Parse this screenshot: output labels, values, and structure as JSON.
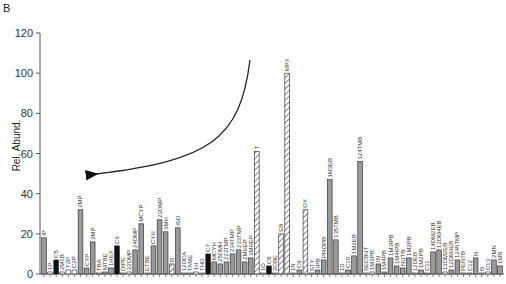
{
  "panel_label": "B",
  "chart_data": {
    "type": "bar",
    "title": "",
    "xlabel": "",
    "ylabel": "Rel. Abund.",
    "ylim": [
      0,
      120
    ],
    "yticks": [
      0,
      20,
      40,
      60,
      80,
      100,
      120
    ],
    "grid": false,
    "legend": null,
    "fill_key": {
      "gray": "#9a9a9a",
      "black": "#111111",
      "hatched": "hatched",
      "white": "#ffffff"
    },
    "annotations": [
      {
        "type": "curved-arrow",
        "from": [
          250,
          60
        ],
        "to": [
          88,
          175
        ],
        "description": "arrow pointing left toward lower-volatility compounds"
      }
    ],
    "bars": [
      {
        "label": "IP",
        "value": 18,
        "fill": "gray"
      },
      {
        "label": "1P",
        "value": 1,
        "fill": "white"
      },
      {
        "label": "C5",
        "value": 7,
        "fill": "black"
      },
      {
        "label": "2M1B",
        "value": 1,
        "fill": "white"
      },
      {
        "label": "T2P",
        "value": 2,
        "fill": "white"
      },
      {
        "label": "C2P",
        "value": 2,
        "fill": "white"
      },
      {
        "label": "2MP",
        "value": 32,
        "fill": "gray"
      },
      {
        "label": "CYP",
        "value": 3,
        "fill": "gray"
      },
      {
        "label": "3MP",
        "value": 16,
        "fill": "gray"
      },
      {
        "label": "TBA",
        "value": 0.5,
        "fill": "white"
      },
      {
        "label": "MTBE",
        "value": 1,
        "fill": "gray"
      },
      {
        "label": "1HEX",
        "value": 3,
        "fill": "gray"
      },
      {
        "label": "C6",
        "value": 14,
        "fill": "black"
      },
      {
        "label": "DIPE",
        "value": 0.5,
        "fill": "white"
      },
      {
        "label": "22DMP",
        "value": 1,
        "fill": "white"
      },
      {
        "label": "24DMP",
        "value": 12,
        "fill": "gray"
      },
      {
        "label": "MCYP",
        "value": 25,
        "fill": "gray"
      },
      {
        "label": "ETBE",
        "value": 0.5,
        "fill": "white"
      },
      {
        "label": "CYH",
        "value": 14,
        "fill": "gray"
      },
      {
        "label": "23DMP",
        "value": 27,
        "fill": "gray"
      },
      {
        "label": "3MH",
        "value": 21,
        "fill": "gray"
      },
      {
        "label": "B",
        "value": 5,
        "fill": "hatched"
      },
      {
        "label": "ISO",
        "value": 23,
        "fill": "gray"
      },
      {
        "label": "12DCA",
        "value": 0.5,
        "fill": "white"
      },
      {
        "label": "TAME",
        "value": 0.5,
        "fill": "white"
      },
      {
        "label": "1H",
        "value": 1,
        "fill": "white"
      },
      {
        "label": "THO",
        "value": 0.5,
        "fill": "white"
      },
      {
        "label": "C7",
        "value": 10,
        "fill": "black"
      },
      {
        "label": "MCYH",
        "value": 6,
        "fill": "gray"
      },
      {
        "label": "25DMH",
        "value": 5,
        "fill": "gray"
      },
      {
        "label": "223TMP",
        "value": 6,
        "fill": "gray"
      },
      {
        "label": "234TMP",
        "value": 10,
        "fill": "gray"
      },
      {
        "label": "233TMP",
        "value": 12,
        "fill": "gray"
      },
      {
        "label": "2MHEP",
        "value": 6,
        "fill": "gray"
      },
      {
        "label": "3MHEP",
        "value": 8,
        "fill": "gray"
      },
      {
        "label": "T",
        "value": 61,
        "fill": "hatched"
      },
      {
        "label": "1O",
        "value": 0.5,
        "fill": "white"
      },
      {
        "label": "C8",
        "value": 4,
        "fill": "black"
      },
      {
        "label": "2OBE",
        "value": 0.5,
        "fill": "white"
      },
      {
        "label": "EB",
        "value": 20,
        "fill": "hatched"
      },
      {
        "label": "MPX",
        "value": 100,
        "fill": "hatched"
      },
      {
        "label": "1N",
        "value": 0.5,
        "fill": "white"
      },
      {
        "label": "C9",
        "value": 2,
        "fill": "gray"
      },
      {
        "label": "OX",
        "value": 32,
        "fill": "hatched"
      },
      {
        "label": "STY",
        "value": 0.5,
        "fill": "white"
      },
      {
        "label": "IPB",
        "value": 2,
        "fill": "gray"
      },
      {
        "label": "PROPB",
        "value": 7,
        "fill": "gray"
      },
      {
        "label": "1M3EB",
        "value": 47,
        "fill": "gray"
      },
      {
        "label": "135TMB",
        "value": 17,
        "fill": "gray"
      },
      {
        "label": "1D",
        "value": 0.5,
        "fill": "white"
      },
      {
        "label": "C10",
        "value": 2,
        "fill": "gray"
      },
      {
        "label": "1M2EB",
        "value": 9,
        "fill": "gray"
      },
      {
        "label": "124TMB",
        "value": 56,
        "fill": "gray"
      },
      {
        "label": "SECBUT",
        "value": 0.5,
        "fill": "white"
      },
      {
        "label": "1M3PB",
        "value": 1,
        "fill": "white"
      },
      {
        "label": "IN",
        "value": 5,
        "fill": "gray"
      },
      {
        "label": "1M4PB",
        "value": 1,
        "fill": "gray"
      },
      {
        "label": "1M3IPB",
        "value": 8,
        "fill": "gray"
      },
      {
        "label": "1M4IPB",
        "value": 4,
        "fill": "gray"
      },
      {
        "label": "NUTB",
        "value": 3,
        "fill": "gray"
      },
      {
        "label": "1M2PB",
        "value": 8,
        "fill": "gray"
      },
      {
        "label": "12DEB",
        "value": 0.5,
        "fill": "white"
      },
      {
        "label": "1M2PB",
        "value": 2,
        "fill": "gray"
      },
      {
        "label": "C11",
        "value": 0.5,
        "fill": "white"
      },
      {
        "label": "14DM2EB",
        "value": 11,
        "fill": "gray"
      },
      {
        "label": "12DM4EB",
        "value": 12,
        "fill": "gray"
      },
      {
        "label": "13DM2EB",
        "value": 1,
        "fill": "white"
      },
      {
        "label": "12DM3EB",
        "value": 2,
        "fill": "gray"
      },
      {
        "label": "1245TMP",
        "value": 7,
        "fill": "gray"
      },
      {
        "label": "PENTB",
        "value": 0.5,
        "fill": "white"
      },
      {
        "label": "C12",
        "value": 0.5,
        "fill": "white"
      },
      {
        "label": "N",
        "value": 8,
        "fill": "gray"
      },
      {
        "label": "B",
        "value": 0.5,
        "fill": "white"
      },
      {
        "label": "C13",
        "value": 1,
        "fill": "white"
      },
      {
        "label": "2MN",
        "value": 7,
        "fill": "gray"
      },
      {
        "label": "1MN",
        "value": 4,
        "fill": "gray"
      }
    ]
  }
}
